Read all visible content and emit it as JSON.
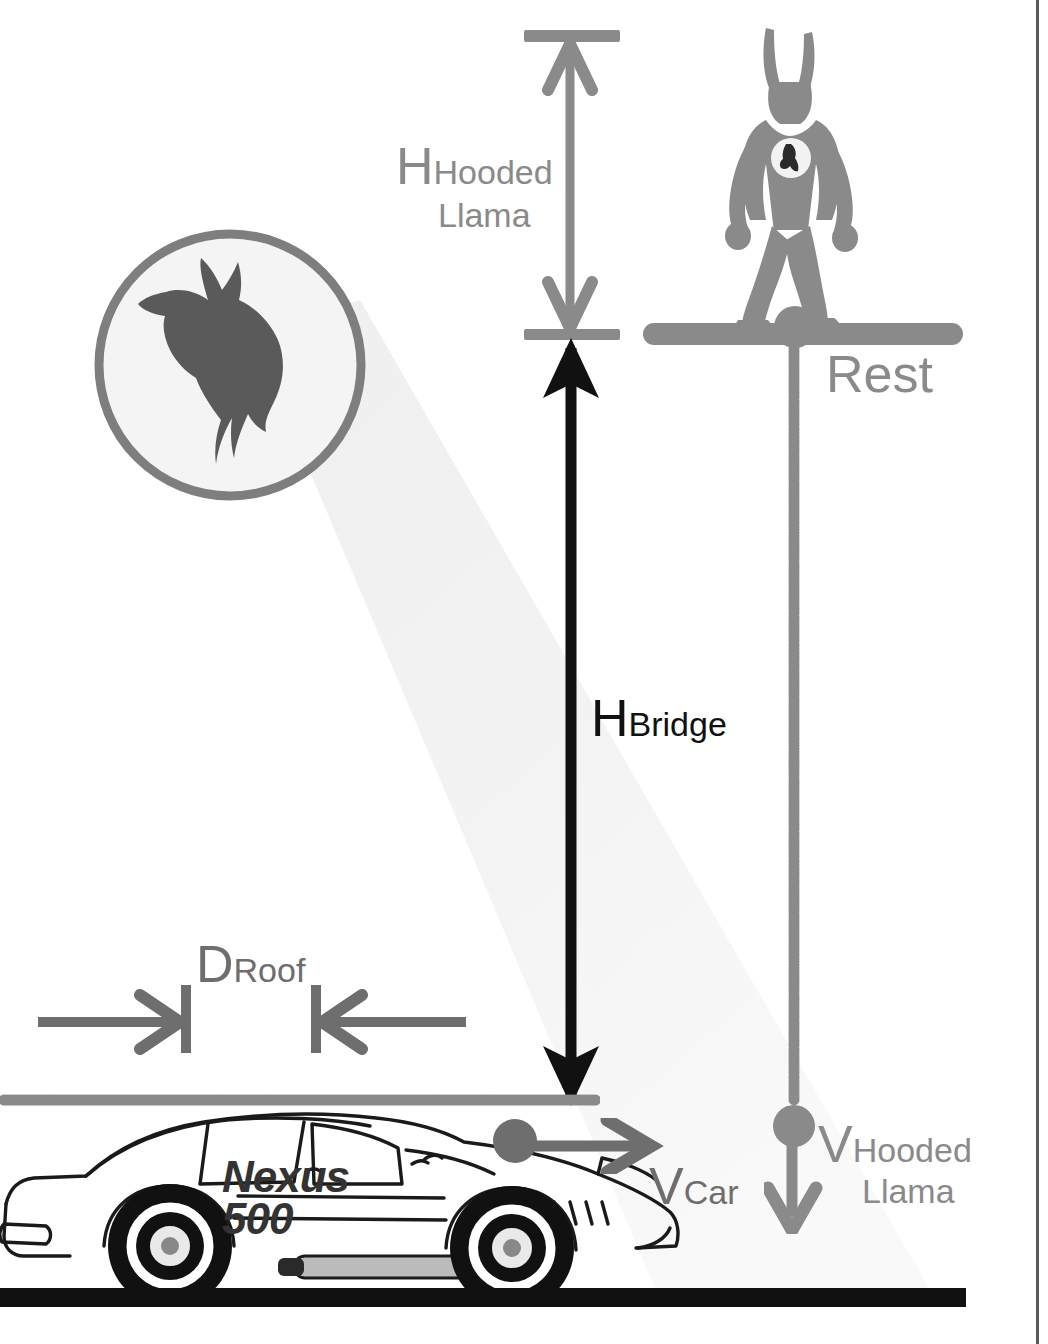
{
  "diagram": {
    "colors": {
      "gray": "#8a8a8a",
      "black": "#111111",
      "logo_fill": "#5a5a5a",
      "beam": "#f0f0f0",
      "ground": "#111111"
    }
  },
  "labels": {
    "h_hooded_llama": {
      "symbol": "H",
      "sub_line1": "Hooded",
      "sub_line2": "Llama",
      "color": "#8a8a8a"
    },
    "h_bridge": {
      "symbol": "H",
      "sub": "Bridge",
      "color": "#111111"
    },
    "rest": {
      "text": "Rest",
      "color": "#8a8a8a"
    },
    "d_roof": {
      "symbol": "D",
      "sub": "Roof",
      "color": "#6e6e6e"
    },
    "v_car": {
      "symbol": "V",
      "sub": "Car",
      "color": "#6e6e6e"
    },
    "v_hooded_llama": {
      "symbol": "V",
      "sub_line1": "Hooded",
      "sub_line2": "Llama",
      "color": "#8a8a8a"
    }
  },
  "car": {
    "brand_line1": "Nexus",
    "brand_line2": "500",
    "icon": "sports-car-side-view"
  },
  "figure": {
    "name": "hooded-llama-superhero",
    "emblem": "llama-head-emblem",
    "state": "standing-at-rest-on-bridge"
  },
  "logo": {
    "name": "llama-head-signal-logo",
    "shape": "circle"
  },
  "markers": {
    "bridge_deck": "bridge-deck",
    "top_reference_bar": "top-reference-bar",
    "bridge_reference_bar": "bridge-reference-bar",
    "ground_line": "ground-line",
    "roof_level_dotted_line": "roof-level-dotted-line",
    "drop_dotted_line": "vertical-drop-dotted-line",
    "car_roof_dot": "car-roof-marker-dot",
    "llama_drop_dot": "llama-drop-marker-dot"
  }
}
